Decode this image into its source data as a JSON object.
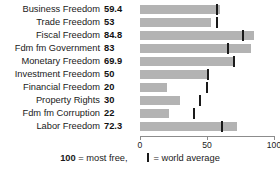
{
  "chart_data": {
    "type": "bar",
    "title": "",
    "subtitle": "",
    "xlabel": "",
    "ylabel": "",
    "orientation": "horizontal",
    "xlim": [
      0,
      100
    ],
    "ticks": [
      0,
      50,
      100
    ],
    "tick_labels": [
      "0",
      "50",
      "100"
    ],
    "grid": false,
    "legend_position": "bottom",
    "bar_color": "#b3b3b3",
    "marker_color": "#1a1a1a",
    "categories": [
      "Business Freedom",
      "Trade Freedom",
      "Fiscal Freedom",
      "Fdm fm Government",
      "Monetary Freedom",
      "Investment Freedom",
      "Financial Freedom",
      "Property Rights",
      "Fdm fm Corruption",
      "Labor Freedom"
    ],
    "values": [
      59.4,
      53,
      84.8,
      83,
      69.9,
      50,
      20,
      30,
      22,
      72.3
    ],
    "value_labels": [
      "59.4",
      "53",
      "84.8",
      "83",
      "69.9",
      "50",
      "20",
      "30",
      "22",
      "72.3"
    ],
    "series": [
      {
        "name": "score",
        "values": [
          59.4,
          53,
          84.8,
          83,
          69.9,
          50,
          20,
          30,
          22,
          72.3
        ]
      },
      {
        "name": "world average",
        "marker": true,
        "values": [
          57.5,
          57.5,
          76.5,
          65.5,
          70.0,
          50.5,
          50.0,
          45.0,
          40.5,
          61.5
        ]
      }
    ],
    "legend": [
      {
        "text_strong": "100",
        "text": "= most free,"
      },
      {
        "marker": true,
        "text": "= world average"
      }
    ]
  }
}
